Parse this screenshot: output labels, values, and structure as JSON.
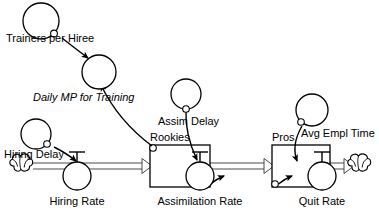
{
  "diagram": {
    "type": "system-dynamics-stock-flow",
    "background_color": "#ffffff",
    "line_color": "#000000",
    "pipe_color": "#4a4a4a"
  },
  "stocks": [
    {
      "id": "rookies",
      "label": "Rookies",
      "x": 150,
      "y": 145,
      "width": 60,
      "height": 42
    },
    {
      "id": "pros",
      "label": "Pros",
      "x": 272,
      "y": 145,
      "width": 58,
      "height": 42
    }
  ],
  "flows": [
    {
      "id": "hiring-rate",
      "label": "Hiring Rate",
      "cx": 77,
      "cy": 176
    },
    {
      "id": "assimilation-rate",
      "label": "Assimilation Rate",
      "cx": 200,
      "cy": 176
    },
    {
      "id": "quit-rate",
      "label": "Quit Rate",
      "cx": 322,
      "cy": 176
    }
  ],
  "auxiliaries": [
    {
      "id": "trainers-per-hiree",
      "label": "Trainers per Hiree",
      "cx": 41,
      "cy": 21
    },
    {
      "id": "daily-mp-for-training",
      "label": "Daily MP for Training",
      "cx": 99,
      "cy": 72
    },
    {
      "id": "hiring-delay",
      "label": "Hiring Delay",
      "cx": 36,
      "cy": 134
    },
    {
      "id": "assim-delay",
      "label": "Assim Delay",
      "cx": 186,
      "cy": 94
    },
    {
      "id": "avg-empl-time",
      "label": "Avg Empl Time",
      "cx": 312,
      "cy": 110
    }
  ],
  "clouds": [
    {
      "id": "source-cloud",
      "cx": 22,
      "cy": 166
    },
    {
      "id": "sink-cloud",
      "cx": 360,
      "cy": 166
    }
  ],
  "connectors": [
    {
      "id": "trainers-to-dailymp",
      "from": "trainers-per-hiree",
      "to": "daily-mp-for-training"
    },
    {
      "id": "rookies-to-dailymp",
      "from": "rookies",
      "to": "daily-mp-for-training"
    },
    {
      "id": "hiring-delay-to-hiring-rate",
      "from": "hiring-delay",
      "to": "hiring-rate"
    },
    {
      "id": "assim-delay-to-assimilation-rate",
      "from": "assim-delay",
      "to": "assimilation-rate"
    },
    {
      "id": "rookies-to-assimilation-rate",
      "from": "rookies",
      "to": "assimilation-rate"
    },
    {
      "id": "avg-empl-time-to-quit-rate",
      "from": "avg-empl-time",
      "to": "quit-rate"
    },
    {
      "id": "pros-to-quit-rate",
      "from": "pros",
      "to": "quit-rate"
    }
  ]
}
